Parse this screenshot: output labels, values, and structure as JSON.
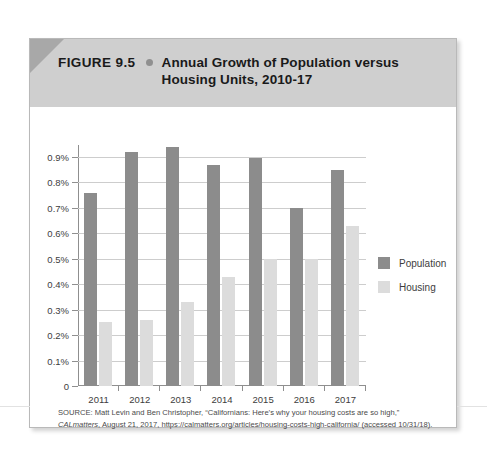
{
  "figure": {
    "number_label": "FIGURE 9.5",
    "bullet_icon": "bullet-dot-icon",
    "title": "Annual Growth of Population versus Housing Units, 2010-17"
  },
  "source": {
    "prefix": "SOURCE: Matt Levin and Ben Christopher, “Californians: Here’s why your housing costs are so high,” ",
    "publication": "CALmatters",
    "suffix": ", August 21, 2017, https://calmatters.org/articles/housing-costs-high-california/ (accessed 10/31/18)."
  },
  "legend": {
    "position": "right",
    "entries": [
      {
        "label": "Population",
        "color": "#8c8c8c"
      },
      {
        "label": "Housing",
        "color": "#dcdcdc"
      }
    ]
  },
  "axis": {
    "y_tick_labels": [
      "0.9%",
      "0.8%",
      "0.7%",
      "0.6%",
      "0.5%",
      "0.4%",
      "0.3%",
      "0.2%",
      "0.1%",
      "0"
    ],
    "x_tick_labels": [
      "2011",
      "2012",
      "2013",
      "2014",
      "2015",
      "2016",
      "2017"
    ]
  },
  "chart_data": {
    "type": "bar",
    "title": "Annual Growth of Population versus Housing Units, 2010-17",
    "xlabel": "",
    "ylabel": "",
    "ylim": [
      0,
      0.9
    ],
    "ytick_step": 0.1,
    "yunit": "%",
    "grid": true,
    "legend_position": "right",
    "categories": [
      "2011",
      "2012",
      "2013",
      "2014",
      "2015",
      "2016",
      "2017"
    ],
    "series": [
      {
        "name": "Population",
        "color": "#8c8c8c",
        "values": [
          0.76,
          0.92,
          0.94,
          0.87,
          0.895,
          0.7,
          0.85
        ]
      },
      {
        "name": "Housing",
        "color": "#dcdcdc",
        "values": [
          0.25,
          0.26,
          0.33,
          0.43,
          0.5,
          0.5,
          0.63
        ]
      }
    ]
  }
}
